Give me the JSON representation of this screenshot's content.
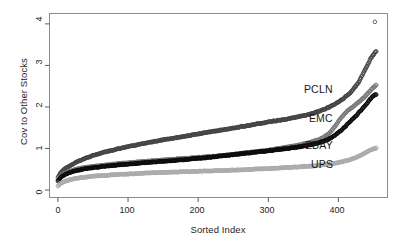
{
  "chart_data": {
    "type": "scatter",
    "title": "",
    "subtitle": "",
    "xlabel": "Sorted Index",
    "ylabel": "Cov to Other Stocks",
    "xlim": [
      -12,
      470
    ],
    "ylim": [
      -0.18,
      4.25
    ],
    "xticks": [
      0,
      100,
      200,
      300,
      400
    ],
    "xtick_labels": [
      "0",
      "100",
      "200",
      "300",
      "400"
    ],
    "yticks": [
      0,
      1,
      2,
      3,
      4
    ],
    "ytick_labels": [
      "0",
      "1",
      "2",
      "3",
      "4"
    ],
    "grid": false,
    "legend_position": "inline-right-annotations",
    "marker": "open-circle",
    "marker_size": 1.8,
    "x_description": "Sorted Index of other stocks, 0 to about 455",
    "series": [
      {
        "name": "PCLN",
        "color": "#454545",
        "label_x": 395,
        "label_y": 2.42,
        "x": [
          0,
          2,
          4,
          7,
          10,
          14,
          18,
          22,
          26,
          30,
          36,
          42,
          50,
          58,
          66,
          76,
          86,
          96,
          108,
          120,
          132,
          144,
          158,
          172,
          186,
          200,
          214,
          228,
          242,
          256,
          270,
          284,
          298,
          312,
          326,
          338,
          350,
          360,
          370,
          378,
          386,
          394,
          400,
          406,
          412,
          418,
          424,
          428,
          432,
          436,
          439,
          442,
          444,
          446,
          448,
          450,
          451,
          452,
          453,
          454
        ],
        "y": [
          0.3,
          0.36,
          0.42,
          0.47,
          0.51,
          0.55,
          0.59,
          0.63,
          0.67,
          0.7,
          0.74,
          0.78,
          0.83,
          0.87,
          0.91,
          0.95,
          0.99,
          1.03,
          1.07,
          1.11,
          1.15,
          1.19,
          1.23,
          1.27,
          1.31,
          1.35,
          1.39,
          1.43,
          1.47,
          1.51,
          1.55,
          1.59,
          1.63,
          1.67,
          1.71,
          1.75,
          1.79,
          1.83,
          1.88,
          1.93,
          1.99,
          2.06,
          2.12,
          2.19,
          2.27,
          2.36,
          2.48,
          2.58,
          2.7,
          2.82,
          2.92,
          3.02,
          3.1,
          3.17,
          3.22,
          3.26,
          3.29,
          3.31,
          3.32,
          3.33
        ]
      },
      {
        "name": "EMC",
        "color": "#7a7a7a",
        "label_x": 395,
        "label_y": 1.7,
        "x": [
          0,
          2,
          4,
          7,
          10,
          14,
          18,
          24,
          30,
          38,
          46,
          56,
          66,
          78,
          90,
          104,
          118,
          132,
          148,
          164,
          180,
          196,
          212,
          228,
          244,
          260,
          276,
          292,
          308,
          322,
          336,
          348,
          360,
          370,
          378,
          384,
          390,
          396,
          402,
          408,
          414,
          420,
          426,
          431,
          436,
          440,
          443,
          446,
          448,
          450,
          452,
          453,
          454
        ],
        "y": [
          0.25,
          0.29,
          0.33,
          0.37,
          0.4,
          0.43,
          0.46,
          0.49,
          0.52,
          0.54,
          0.56,
          0.58,
          0.6,
          0.62,
          0.64,
          0.66,
          0.68,
          0.7,
          0.72,
          0.74,
          0.76,
          0.78,
          0.8,
          0.82,
          0.85,
          0.88,
          0.91,
          0.94,
          0.98,
          1.02,
          1.06,
          1.1,
          1.15,
          1.2,
          1.26,
          1.33,
          1.42,
          1.55,
          1.7,
          1.82,
          1.92,
          2.0,
          2.08,
          2.15,
          2.22,
          2.29,
          2.35,
          2.4,
          2.44,
          2.47,
          2.5,
          2.52,
          2.53
        ]
      },
      {
        "name": "EBAY",
        "color": "#0d0d0d",
        "label_x": 395,
        "label_y": 1.07,
        "x": [
          0,
          2,
          4,
          7,
          10,
          14,
          18,
          24,
          30,
          38,
          46,
          56,
          66,
          78,
          90,
          104,
          118,
          132,
          148,
          164,
          180,
          196,
          212,
          228,
          244,
          260,
          276,
          292,
          308,
          322,
          336,
          348,
          360,
          370,
          378,
          384,
          390,
          396,
          402,
          408,
          414,
          420,
          426,
          431,
          436,
          440,
          443,
          446,
          448,
          450,
          452,
          453,
          454
        ],
        "y": [
          0.22,
          0.26,
          0.3,
          0.34,
          0.37,
          0.4,
          0.43,
          0.46,
          0.48,
          0.51,
          0.53,
          0.55,
          0.57,
          0.59,
          0.61,
          0.63,
          0.65,
          0.67,
          0.69,
          0.71,
          0.73,
          0.76,
          0.78,
          0.81,
          0.84,
          0.87,
          0.9,
          0.93,
          0.96,
          0.99,
          1.02,
          1.05,
          1.09,
          1.13,
          1.17,
          1.21,
          1.26,
          1.33,
          1.41,
          1.5,
          1.6,
          1.7,
          1.8,
          1.9,
          1.99,
          2.07,
          2.14,
          2.2,
          2.24,
          2.27,
          2.29,
          2.3,
          2.31
        ]
      },
      {
        "name": "UPS",
        "color": "#ababab",
        "label_x": 395,
        "label_y": 0.6,
        "x": [
          0,
          2,
          4,
          7,
          10,
          14,
          20,
          26,
          34,
          44,
          54,
          66,
          80,
          94,
          110,
          126,
          144,
          162,
          180,
          198,
          216,
          234,
          252,
          270,
          288,
          306,
          322,
          338,
          352,
          364,
          374,
          384,
          392,
          400,
          408,
          414,
          420,
          426,
          431,
          436,
          440,
          443,
          446,
          448,
          450,
          452,
          453,
          454
        ],
        "y": [
          0.09,
          0.13,
          0.16,
          0.19,
          0.21,
          0.23,
          0.26,
          0.28,
          0.3,
          0.32,
          0.34,
          0.35,
          0.37,
          0.38,
          0.39,
          0.41,
          0.42,
          0.43,
          0.44,
          0.45,
          0.46,
          0.47,
          0.48,
          0.49,
          0.51,
          0.52,
          0.54,
          0.55,
          0.57,
          0.58,
          0.6,
          0.62,
          0.64,
          0.66,
          0.69,
          0.72,
          0.75,
          0.79,
          0.83,
          0.87,
          0.91,
          0.94,
          0.97,
          0.98,
          0.99,
          1.0,
          1.0,
          1.01
        ]
      }
    ],
    "outliers": [
      {
        "series": "PCLN",
        "x": 452,
        "y": 4.05,
        "color": "#5a5a5a"
      }
    ]
  },
  "axes": {
    "frame_color": "#8c8c8c",
    "tick_color": "#5a5a5a"
  },
  "labels": {
    "pcln": "PCLN",
    "emc": "EMC",
    "ebay": "EBAY",
    "ups": "UPS"
  }
}
